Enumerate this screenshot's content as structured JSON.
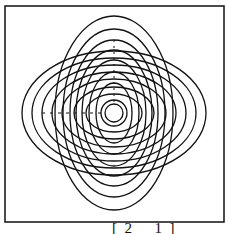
{
  "figure": {
    "frame": {
      "x": 5,
      "y": 6,
      "width": 219,
      "height": 216
    },
    "center": {
      "x": 114,
      "y": 113
    },
    "stroke_color": "#111111",
    "tall_ellipses": [
      {
        "rx": 59,
        "ry": 97
      },
      {
        "rx": 51,
        "ry": 84
      },
      {
        "rx": 44,
        "ry": 73
      },
      {
        "rx": 38,
        "ry": 63
      },
      {
        "rx": 32,
        "ry": 53
      },
      {
        "rx": 25,
        "ry": 41
      },
      {
        "rx": 18,
        "ry": 30
      }
    ],
    "wide_ellipses": [
      {
        "rx": 92,
        "ry": 62
      },
      {
        "rx": 82,
        "ry": 55
      },
      {
        "rx": 72,
        "ry": 48
      },
      {
        "rx": 62,
        "ry": 41
      },
      {
        "rx": 52,
        "ry": 34
      },
      {
        "rx": 40,
        "ry": 26
      },
      {
        "rx": 28,
        "ry": 19
      }
    ],
    "center_circles": [
      {
        "r": 9
      },
      {
        "r": 13
      }
    ],
    "vertical_dashed_axis": {
      "x": 114,
      "y1": 40,
      "y2": 104
    },
    "horizontal_dashed_axis": {
      "y": 113,
      "x1": 42,
      "x2": 104
    }
  },
  "caption": {
    "matrix_text": "[  2      1  ]"
  }
}
